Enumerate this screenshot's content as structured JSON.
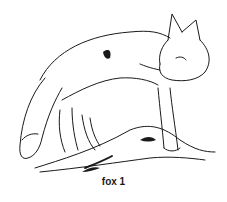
{
  "figure": {
    "caption": "fox 1",
    "ink_color": "#1a1a1a",
    "background": "#ffffff"
  }
}
